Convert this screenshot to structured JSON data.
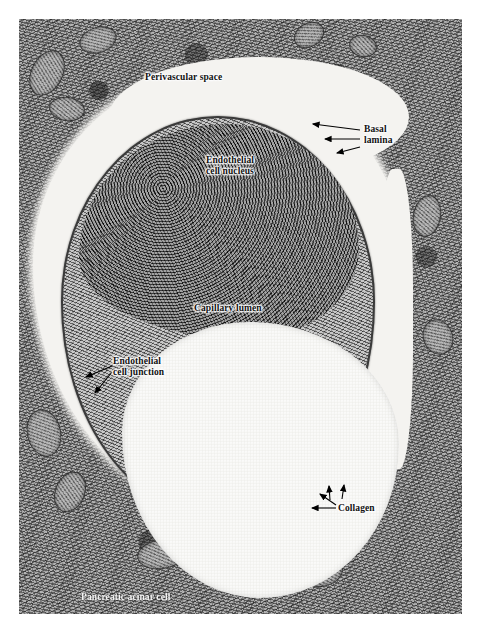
{
  "figure": {
    "type": "transmission-electron-micrograph",
    "background_color": "#ffffff",
    "plate_color": "#b9b9b9"
  },
  "labels": [
    {
      "id": "perivascular-space",
      "text": "Perivascular space",
      "style": "on-tissue",
      "x": 145,
      "y": 72,
      "leaders": []
    },
    {
      "id": "basal-lamina",
      "text": "Basal\nlamina",
      "style": "on-tissue",
      "x": 364,
      "y": 124,
      "leaders": [
        {
          "x1": 360,
          "y1": 130,
          "x2": 313,
          "y2": 124
        },
        {
          "x1": 360,
          "y1": 139,
          "x2": 325,
          "y2": 139
        },
        {
          "x1": 360,
          "y1": 147,
          "x2": 337,
          "y2": 153
        }
      ]
    },
    {
      "id": "endothelial-cell-nucleus",
      "text": "Endothelial\ncell nucleus",
      "style": "on-tissue",
      "x": 206,
      "y": 155,
      "leaders": []
    },
    {
      "id": "capillary-lumen",
      "text": "Capillary lumen",
      "style": "on-tissue",
      "x": 194,
      "y": 303,
      "leaders": []
    },
    {
      "id": "endothelial-cell-junction",
      "text": "Endothelial\ncell junction",
      "style": "on-tissue",
      "x": 113,
      "y": 356,
      "leaders": [
        {
          "x1": 112,
          "y1": 366,
          "x2": 86,
          "y2": 377
        },
        {
          "x1": 112,
          "y1": 372,
          "x2": 95,
          "y2": 393
        }
      ]
    },
    {
      "id": "collagen",
      "text": "Collagen",
      "style": "on-tissue",
      "x": 338,
      "y": 503,
      "leaders": [
        {
          "x1": 336,
          "y1": 508,
          "x2": 312,
          "y2": 508
        },
        {
          "x1": 336,
          "y1": 505,
          "x2": 320,
          "y2": 494
        },
        {
          "x1": 330,
          "y1": 500,
          "x2": 329,
          "y2": 486
        },
        {
          "x1": 342,
          "y1": 499,
          "x2": 344,
          "y2": 485
        }
      ]
    },
    {
      "id": "pancreatic-acinar-cell",
      "text": "Pancreatic acinar cell",
      "style": "inverse",
      "x": 81,
      "y": 592,
      "leaders": []
    }
  ],
  "regions": [
    {
      "id": "perivascular-space-region",
      "name": "perivascular space"
    },
    {
      "id": "capillary-wall-region",
      "name": "endothelial cell / capillary wall"
    },
    {
      "id": "endothelial-nucleus-region",
      "name": "endothelial cell nucleus"
    },
    {
      "id": "capillary-lumen-region",
      "name": "capillary lumen"
    },
    {
      "id": "acinar-tissue-region",
      "name": "pancreatic acinar cell cytoplasm"
    }
  ]
}
